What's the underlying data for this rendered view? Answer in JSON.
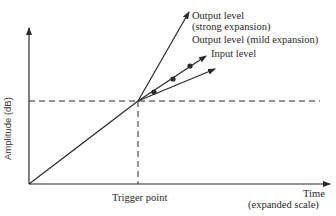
{
  "diagram": {
    "type": "amplitude-vs-time expansion diagram",
    "axes": {
      "y_label": "Amplitude (dB)",
      "x_label_line1": "Time",
      "x_label_line2": "(expanded scale)"
    },
    "markers": {
      "trigger_point": "Trigger point"
    },
    "curves": [
      {
        "id": "strong",
        "label_line1": "Output level",
        "label_line2": "(strong expansion)"
      },
      {
        "id": "mild",
        "label_line1": "Output level (mild expansion)"
      },
      {
        "id": "input",
        "label_line1": "Input level",
        "marker": "dots"
      }
    ],
    "colors": {
      "ink": "#2a2a2a",
      "background": "#ffffff"
    }
  }
}
